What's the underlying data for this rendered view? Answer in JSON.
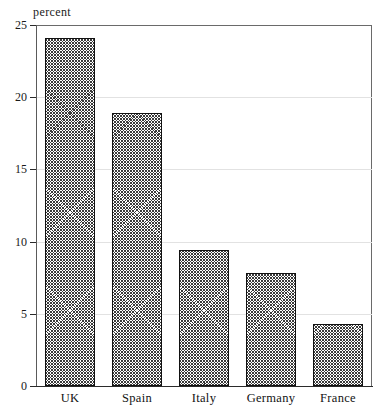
{
  "chart_data": {
    "type": "bar",
    "title": "",
    "subtitle": "",
    "xlabel": "",
    "ylabel": "percent",
    "unit_label": "percent",
    "categories": [
      "UK",
      "Spain",
      "Italy",
      "Germany",
      "France"
    ],
    "values": [
      24.1,
      18.9,
      9.4,
      7.8,
      4.3
    ],
    "ylim": [
      0,
      25
    ],
    "ytick_labels": [
      "0",
      "5",
      "10",
      "15",
      "20",
      "25"
    ],
    "ytick_values": [
      0,
      5,
      10,
      15,
      20,
      25
    ],
    "grid": "horizontal-faint",
    "legend": "none",
    "bar_fill": "diagonal-crosshatch",
    "bar_edge_color": "#111111",
    "annotations": []
  },
  "axis": {
    "y_unit_caption": "percent"
  }
}
